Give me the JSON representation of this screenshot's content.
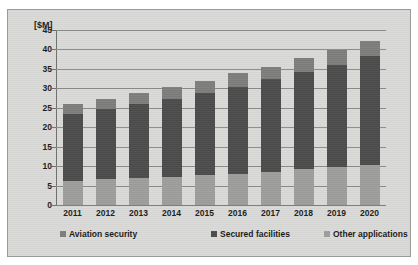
{
  "chart_data": {
    "type": "bar",
    "subtype": "stacked-bar",
    "title": "",
    "subtitle": "",
    "xlabel": "",
    "ylabel": "[$M]",
    "ylim": [
      0,
      45
    ],
    "ytick_step": 5,
    "yticks": [
      "45",
      "40",
      "35",
      "30",
      "25",
      "20",
      "15",
      "10",
      "5",
      "0"
    ],
    "grid": true,
    "legend_position": "bottom",
    "categories": [
      "2011",
      "2012",
      "2013",
      "2014",
      "2015",
      "2016",
      "2017",
      "2018",
      "2019",
      "2020"
    ],
    "series": [
      {
        "name": "Other applications",
        "color": "#9d9d9b",
        "stack_order": 0,
        "values": [
          6.3,
          6.8,
          7.0,
          7.2,
          7.8,
          8.1,
          8.5,
          9.3,
          9.7,
          10.3
        ]
      },
      {
        "name": "Secured facilities",
        "color": "#4b4b4b",
        "stack_order": 1,
        "values": [
          17.2,
          17.8,
          19.0,
          20.0,
          20.9,
          22.3,
          23.8,
          24.9,
          26.4,
          28.0
        ]
      },
      {
        "name": "Aviation security",
        "color": "#7d7d7b",
        "stack_order": 2,
        "values": [
          2.5,
          2.6,
          2.8,
          3.1,
          3.3,
          3.5,
          3.3,
          3.6,
          3.8,
          4.0
        ]
      }
    ],
    "totals": [
      26.0,
      27.2,
      28.8,
      30.3,
      32.0,
      33.9,
      35.6,
      37.8,
      39.9,
      42.3
    ]
  },
  "legend": {
    "items": [
      {
        "label": "Aviation security",
        "color": "#7d7d7b"
      },
      {
        "label": "Secured facilities",
        "color": "#4b4b4b"
      },
      {
        "label": "Other applications",
        "color": "#9d9d9b"
      }
    ]
  },
  "colors": {
    "figure_background": "#d9d9d7",
    "figure_border": "#9a9a98",
    "gridline": "#8b8b89",
    "axis": "#6e6e6c",
    "text": "#1a1a1a"
  }
}
